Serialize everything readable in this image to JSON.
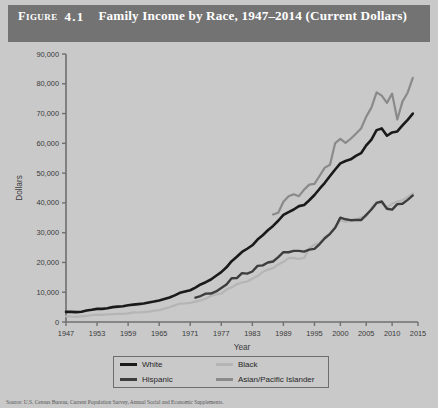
{
  "figure": {
    "label": "Figure",
    "number": "4.1",
    "title": "Family Income by Race, 1947–2014 (Current Dollars)"
  },
  "legend": {
    "items": [
      {
        "label": "White",
        "color": "#1a1a1a"
      },
      {
        "label": "Black",
        "color": "#b5b5b5"
      },
      {
        "label": "Hispanic",
        "color": "#3d3d3d"
      },
      {
        "label": "Asian/Pacific Islander",
        "color": "#8a8a8a"
      }
    ]
  },
  "source_note": "Source: U.S. Census Bureau, Current Population Survey, Annual Social and Economic Supplements.",
  "chart_data": {
    "type": "line",
    "title": "Family Income by Race, 1947–2014 (Current Dollars)",
    "xlabel": "Year",
    "ylabel": "Dollars",
    "xlim": [
      1947,
      2015
    ],
    "ylim": [
      0,
      90000
    ],
    "ytick_labels": [
      "0",
      "10,000",
      "20,000",
      "30,000",
      "40,000",
      "50,000",
      "60,000",
      "70,000",
      "80,000",
      "90,000"
    ],
    "ytick_values": [
      0,
      10000,
      20000,
      30000,
      40000,
      50000,
      60000,
      70000,
      80000,
      90000
    ],
    "xtick_values": [
      1947,
      1953,
      1959,
      1965,
      1971,
      1977,
      1983,
      1989,
      1995,
      2000,
      2005,
      2010,
      2015
    ],
    "xtick_labels": [
      "1947",
      "1953",
      "1959",
      "1965",
      "1971",
      "1977",
      "1983",
      "1989",
      "1995",
      "2000",
      "2005",
      "2010",
      "2015"
    ],
    "grid": false,
    "legend_position": "bottom",
    "series": [
      {
        "name": "White",
        "color": "#1a1a1a",
        "x": [
          1947,
          1948,
          1949,
          1950,
          1951,
          1952,
          1953,
          1954,
          1955,
          1956,
          1957,
          1958,
          1959,
          1960,
          1961,
          1962,
          1963,
          1964,
          1965,
          1966,
          1967,
          1968,
          1969,
          1970,
          1971,
          1972,
          1973,
          1974,
          1975,
          1976,
          1977,
          1978,
          1979,
          1980,
          1981,
          1982,
          1983,
          1984,
          1985,
          1986,
          1987,
          1988,
          1989,
          1990,
          1991,
          1992,
          1993,
          1994,
          1995,
          1996,
          1997,
          1998,
          1999,
          2000,
          2001,
          2002,
          2003,
          2004,
          2005,
          2006,
          2007,
          2008,
          2009,
          2010,
          2011,
          2012,
          2013,
          2014
        ],
        "values": [
          3400,
          3400,
          3300,
          3450,
          3850,
          4100,
          4400,
          4400,
          4600,
          4990,
          5160,
          5300,
          5640,
          5840,
          6000,
          6200,
          6550,
          6860,
          7250,
          7720,
          8230,
          8940,
          9790,
          10240,
          10670,
          11550,
          12600,
          13360,
          14270,
          15540,
          16740,
          18370,
          20440,
          21900,
          23520,
          24600,
          25760,
          27690,
          29150,
          30810,
          32270,
          34000,
          35980,
          36920,
          37780,
          38910,
          39300,
          40880,
          42650,
          44760,
          46750,
          49020,
          51220,
          53260,
          54070,
          54630,
          55770,
          56700,
          59320,
          61280,
          64430,
          65000,
          62550,
          63650,
          64000,
          66000,
          67900,
          70000
        ]
      },
      {
        "name": "Black",
        "color": "#b5b5b5",
        "x": [
          1947,
          1948,
          1949,
          1950,
          1951,
          1952,
          1953,
          1954,
          1955,
          1956,
          1957,
          1958,
          1959,
          1960,
          1961,
          1962,
          1963,
          1964,
          1965,
          1966,
          1967,
          1968,
          1969,
          1970,
          1971,
          1972,
          1973,
          1974,
          1975,
          1976,
          1977,
          1978,
          1979,
          1980,
          1981,
          1982,
          1983,
          1984,
          1985,
          1986,
          1987,
          1988,
          1989,
          1990,
          1991,
          1992,
          1993,
          1994,
          1995,
          1996,
          1997,
          1998,
          1999,
          2000,
          2001,
          2002,
          2003,
          2004,
          2005,
          2006,
          2007,
          2008,
          2009,
          2010,
          2011,
          2012,
          2013,
          2014
        ],
        "values": [
          1900,
          1850,
          1750,
          1870,
          2030,
          2340,
          2460,
          2410,
          2550,
          2630,
          2760,
          2710,
          2920,
          3230,
          3190,
          3330,
          3460,
          3840,
          3990,
          4500,
          4940,
          5590,
          6190,
          6280,
          6440,
          6860,
          7270,
          7810,
          8780,
          9240,
          9560,
          10880,
          11640,
          12670,
          13270,
          13600,
          14510,
          15430,
          16790,
          17600,
          18100,
          19330,
          20210,
          21420,
          21550,
          21160,
          21540,
          24700,
          25970,
          26520,
          28600,
          29400,
          31780,
          34190,
          33600,
          34000,
          34370,
          35160,
          35460,
          38270,
          40220,
          39900,
          38410,
          39720,
          40500,
          40900,
          42000,
          43200
        ]
      },
      {
        "name": "Hispanic",
        "color": "#3d3d3d",
        "x": [
          1972,
          1973,
          1974,
          1975,
          1976,
          1977,
          1978,
          1979,
          1980,
          1981,
          1982,
          1983,
          1984,
          1985,
          1986,
          1987,
          1988,
          1989,
          1990,
          1991,
          1992,
          1993,
          1994,
          1995,
          1996,
          1997,
          1998,
          1999,
          2000,
          2001,
          2002,
          2003,
          2004,
          2005,
          2006,
          2007,
          2008,
          2009,
          2010,
          2011,
          2012,
          2013,
          2014
        ],
        "values": [
          8180,
          8720,
          9540,
          9550,
          10260,
          11420,
          12570,
          14710,
          14720,
          16400,
          16230,
          16960,
          18830,
          19030,
          19990,
          20310,
          21770,
          23450,
          23430,
          23900,
          23900,
          23650,
          24320,
          24570,
          26180,
          28140,
          29610,
          31660,
          35050,
          34500,
          34190,
          34270,
          34240,
          35970,
          37780,
          40000,
          40470,
          38040,
          37760,
          39600,
          39700,
          41000,
          42500
        ]
      },
      {
        "name": "Asian/Pacific Islander",
        "color": "#8a8a8a",
        "x": [
          1987,
          1988,
          1989,
          1990,
          1991,
          1992,
          1993,
          1994,
          1995,
          1996,
          1997,
          1998,
          1999,
          2000,
          2001,
          2002,
          2003,
          2004,
          2005,
          2006,
          2007,
          2008,
          2009,
          2010,
          2011,
          2012,
          2013,
          2014
        ],
        "values": [
          36100,
          36700,
          40400,
          42250,
          42900,
          42250,
          44460,
          46120,
          46360,
          49110,
          51850,
          52830,
          60100,
          61520,
          60150,
          61540,
          63250,
          65000,
          68960,
          72000,
          77130,
          76000,
          73600,
          76700,
          68000,
          74000,
          77000,
          82000
        ]
      }
    ]
  }
}
